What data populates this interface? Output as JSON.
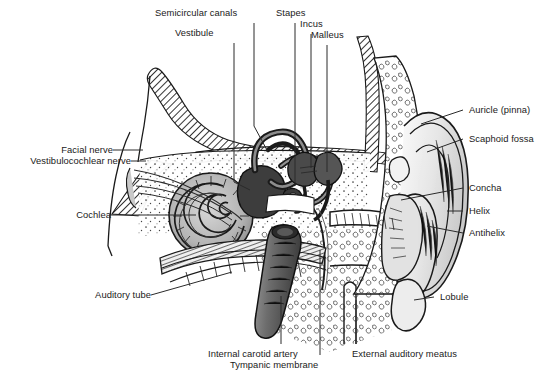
{
  "figure": {
    "background_color": "#ffffff",
    "ink_color": "#1a1a1a",
    "width": 549,
    "height": 382
  },
  "labels": {
    "semicircular_canals": "Semicircular canals",
    "vestibule": "Vestibule",
    "stapes": "Stapes",
    "incus": "Incus",
    "malleus": "Malleus",
    "auricle_pinna": "Auricle (pinna)",
    "scaphoid_fossa": "Scaphoid fossa",
    "concha": "Concha",
    "helix": "Helix",
    "antihelix": "Antihelix",
    "lobule": "Lobule",
    "facial_nerve": "Facial nerve",
    "vestibulocochlear_nerve": "Vestibulocochlear nerve",
    "cochlea": "Cochlea",
    "auditory_tube": "Auditory tube",
    "internal_carotid_artery": "Internal carotid artery",
    "tympanic_membrane": "Tympanic membrane",
    "external_auditory_meatus": "External auditory meatus"
  },
  "regions": {
    "inner_ear": "Inner ear",
    "middle_ear": "Middle ear",
    "outer_ear": "Outer ear"
  }
}
